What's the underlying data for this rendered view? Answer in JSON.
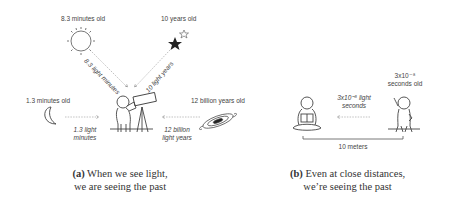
{
  "panel_a": {
    "sun": {
      "age": "8.3 minutes old",
      "distance": "8.3 light minutes"
    },
    "star": {
      "age": "10 years old",
      "distance": "10 light years"
    },
    "moon": {
      "age": "1.3 minutes old",
      "distance_line1": "1.3 light",
      "distance_line2": "minutes"
    },
    "galaxy": {
      "age": "12 billion years old",
      "distance_line1": "12 billion",
      "distance_line2": "light years"
    },
    "caption_label": "(a)",
    "caption_line1": "When we see light,",
    "caption_line2": "we are seeing the past"
  },
  "panel_b": {
    "person": {
      "age_line1": "3x10⁻⁸",
      "age_line2": "seconds old"
    },
    "light": {
      "line1": "3x10⁻⁸ light",
      "line2": "seconds"
    },
    "distance": "10 meters",
    "caption_label": "(b)",
    "caption_line1": "Even at close distances,",
    "caption_line2": "we’re seeing the past"
  },
  "colors": {
    "line": "#555555",
    "dashed": "#888888",
    "text": "#444444"
  }
}
